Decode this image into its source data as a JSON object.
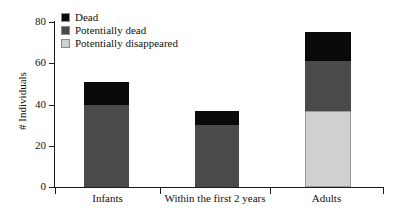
{
  "chart_data": {
    "type": "bar",
    "stacked": true,
    "title": "",
    "xlabel": "",
    "ylabel": "# Individuals",
    "ylim": [
      0,
      80
    ],
    "yticks": [
      0,
      20,
      40,
      60,
      80
    ],
    "ytick_labels": [
      "0",
      "20",
      "40",
      "60",
      "80"
    ],
    "grid": false,
    "legend_position": "top-left",
    "categories": [
      "Infants",
      "Within the first 2 years",
      "Adults"
    ],
    "series": [
      {
        "name": "Potentially disappeared",
        "color": "#d0d0d0",
        "values": [
          0,
          0,
          37
        ]
      },
      {
        "name": "Potentially dead",
        "color": "#4a4a4a",
        "values": [
          40,
          30,
          24
        ]
      },
      {
        "name": "Dead",
        "color": "#0a0a0a",
        "values": [
          11,
          7,
          14
        ]
      }
    ],
    "totals": [
      51,
      37,
      75
    ]
  },
  "legend": {
    "items": [
      {
        "label": "Dead",
        "color": "#0a0a0a"
      },
      {
        "label": "Potentially dead",
        "color": "#4a4a4a"
      },
      {
        "label": "Potentially disappeared",
        "color": "#d0d0d0"
      }
    ]
  },
  "axis": {
    "y_label": "# Individuals",
    "y_ticks": [
      "80",
      "60",
      "40",
      "20",
      "0"
    ],
    "x_categories": [
      "Infants",
      "Within the first 2 years",
      "Adults"
    ]
  }
}
